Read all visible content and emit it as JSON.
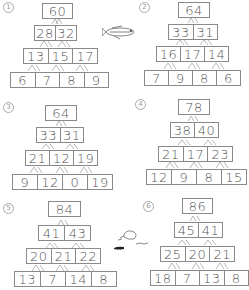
{
  "pyramids": [
    {
      "label": "1",
      "rows": [
        [
          "60"
        ],
        [
          "28",
          "32"
        ],
        [
          "13",
          "15",
          "17"
        ],
        [
          "6",
          "7",
          "8",
          "9"
        ]
      ]
    },
    {
      "label": "2",
      "rows": [
        [
          "64"
        ],
        [
          "33",
          "31"
        ],
        [
          "16",
          "17",
          "14"
        ],
        [
          "7",
          "9",
          "8",
          "6"
        ]
      ]
    },
    {
      "label": "3",
      "rows": [
        [
          "64"
        ],
        [
          "33",
          "31"
        ],
        [
          "21",
          "12",
          "19"
        ],
        [
          "9",
          "12",
          "0",
          "19"
        ]
      ]
    },
    {
      "label": "4",
      "rows": [
        [
          "78"
        ],
        [
          "38",
          "40"
        ],
        [
          "21",
          "17",
          "23"
        ],
        [
          "12",
          "9",
          "8",
          "15"
        ]
      ]
    },
    {
      "label": "5",
      "rows": [
        [
          "84"
        ],
        [
          "41",
          "43"
        ],
        [
          "20",
          "21",
          "22"
        ],
        [
          "13",
          "7",
          "14",
          "8"
        ]
      ]
    },
    {
      "label": "6",
      "rows": [
        [
          "86"
        ],
        [
          "45",
          "41"
        ],
        [
          "25",
          "20",
          "21"
        ],
        [
          "18",
          "7",
          "13",
          "8"
        ]
      ]
    }
  ],
  "decorations": [
    "fish-illustration",
    "bird-on-grass-illustration"
  ]
}
